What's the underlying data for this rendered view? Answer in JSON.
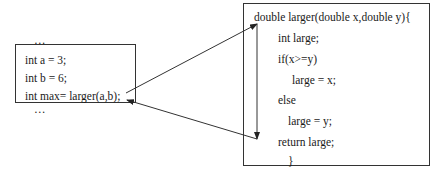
{
  "caller": {
    "lines": [
      "…",
      "int a = 3;",
      "int b = 6;",
      "int max= larger(a,b);",
      "…"
    ]
  },
  "callee": {
    "lines": [
      "double larger(double x,double y){",
      "int large;",
      "if(x>=y)",
      "large = x;",
      "else",
      "large = y;",
      "return large;",
      "}"
    ]
  },
  "arrows": [
    {
      "name": "call-arrow",
      "from": "int max= larger(a,b);",
      "to": "double larger(double x,double y){"
    },
    {
      "name": "flow-arrow",
      "from": "double larger(double x,double y){",
      "to": "return large;"
    },
    {
      "name": "return-arrow",
      "from": "return large;",
      "to": "int max= larger(a,b);"
    }
  ]
}
